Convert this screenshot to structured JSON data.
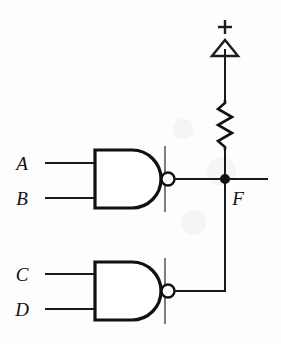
{
  "diagram": {
    "type": "logic-circuit-schematic",
    "background_color": "#fdfdfd",
    "line_color": "#111111"
  },
  "supply": {
    "plus_label": "+",
    "symbol": "triangle-supply",
    "description": "positive supply rail terminal"
  },
  "resistor": {
    "symbol": "zigzag-resistor",
    "label": "",
    "description": "pull-up resistor between supply and output node"
  },
  "gates": [
    {
      "id": "gate-upper",
      "type": "NAND",
      "marking": "open-collector-bar",
      "inputs": [
        {
          "label": "A"
        },
        {
          "label": "B"
        }
      ],
      "output_node": "F"
    },
    {
      "id": "gate-lower",
      "type": "NAND",
      "marking": "open-collector-bar",
      "inputs": [
        {
          "label": "C"
        },
        {
          "label": "D"
        }
      ],
      "output_node": "F"
    }
  ],
  "nodes": [
    {
      "id": "output-node",
      "label": "F",
      "junction": true,
      "description": "wired-AND output node joining both NAND outputs and the pull-up resistor"
    }
  ]
}
